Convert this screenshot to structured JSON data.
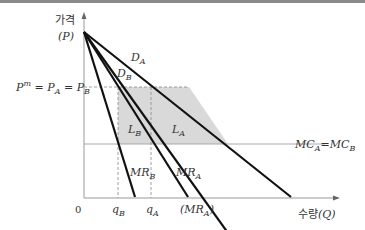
{
  "axes": {
    "y_label_kr": "가격",
    "y_label_sym": "(P)",
    "x_label_kr": "수량",
    "x_label_sym": "(Q)",
    "origin": "0"
  },
  "curves": {
    "demand_A": "D",
    "demand_A_sub": "A",
    "demand_B": "D",
    "demand_B_sub": "B",
    "mr_A": "MR",
    "mr_A_sub": "A",
    "mr_B": "MR",
    "mr_B_sub": "B",
    "mc": "MC",
    "mc_sub_A": "A",
    "mc_eq": "=",
    "mc_sub_B": "B"
  },
  "price_label": {
    "pm": "P",
    "pm_sup": "m",
    "eq1": " = ",
    "pa": "P",
    "pa_sub": "A",
    "eq2": " = ",
    "pb": "P",
    "pb_sub": "B"
  },
  "areas": {
    "l_b": "L",
    "l_b_sub": "B",
    "l_a": "L",
    "l_a_sub": "A"
  },
  "x_ticks": {
    "q_b": "q",
    "q_b_sub": "B",
    "q_a": "q",
    "q_a_sub": "A",
    "mr_a_intercept": "(MR",
    "mr_a_intercept_sub": "A",
    "mr_a_intercept_close": ")"
  },
  "colors": {
    "shade": "#d9d9d9",
    "curve": "#111111",
    "axis": "#999999",
    "mc_line": "#aaaaaa"
  }
}
